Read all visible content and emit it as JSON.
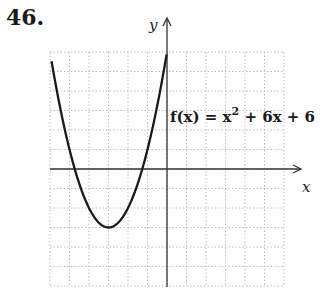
{
  "problem": {
    "number": "46."
  },
  "chart_data": {
    "type": "line",
    "title": "",
    "function_label": "f(x) = x^2 + 6x + 6",
    "function_label_parts": {
      "lhs": "f(x) = x",
      "exp": "2",
      "rhs": " + 6x + 6"
    },
    "xlabel": "x",
    "ylabel": "y",
    "xlim": [
      -6,
      6
    ],
    "ylim": [
      -6,
      6
    ],
    "grid": true,
    "grid_step": 1,
    "curve": {
      "expression": "x^2 + 6x + 6",
      "vertex": [
        -3,
        -3
      ],
      "x_intercepts": [
        -4.73,
        -1.27
      ],
      "y_intercept": 6,
      "points": [
        [
          -5.9,
          5.41
        ],
        [
          -5,
          1
        ],
        [
          -4,
          -2
        ],
        [
          -3,
          -3
        ],
        [
          -2,
          -2
        ],
        [
          -1,
          1
        ],
        [
          0,
          6
        ]
      ]
    },
    "colors": {
      "curve": "#1a1a1a",
      "axis": "#333333",
      "grid": "#bdbdbd"
    }
  }
}
